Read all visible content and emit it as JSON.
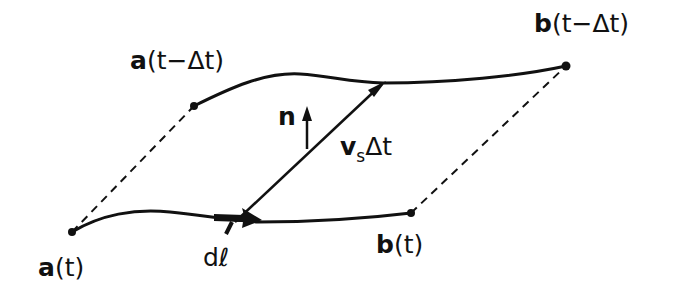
{
  "diagram": {
    "type": "geometric-construction",
    "colors": {
      "ink": "#111111",
      "background": "#ffffff"
    },
    "points": {
      "a_t": {
        "label_bold": "a",
        "label_rest": "(t)",
        "x": 72,
        "y": 232
      },
      "a_prev": {
        "label_bold": "a",
        "label_rest": "(t−Δt)",
        "x": 194,
        "y": 106
      },
      "b_prev": {
        "label_bold": "b",
        "label_rest": "(t−Δt)",
        "x": 566,
        "y": 66
      },
      "b_t": {
        "label_bold": "b",
        "label_rest": "(t)",
        "x": 411,
        "y": 213
      }
    },
    "vectors": {
      "normal": {
        "label": "n"
      },
      "velocity": {
        "label_main": "v",
        "label_sub": "s",
        "label_rest": "Δt"
      },
      "line_element": {
        "label": "dℓ"
      }
    },
    "edges": [
      {
        "from": "a_t",
        "to": "a_prev",
        "style": "dashed"
      },
      {
        "from": "b_t",
        "to": "b_prev",
        "style": "dashed"
      },
      {
        "from": "a_prev",
        "to": "b_prev",
        "style": "solid-curve"
      },
      {
        "from": "a_t",
        "to": "b_t",
        "style": "solid-curve"
      }
    ]
  }
}
